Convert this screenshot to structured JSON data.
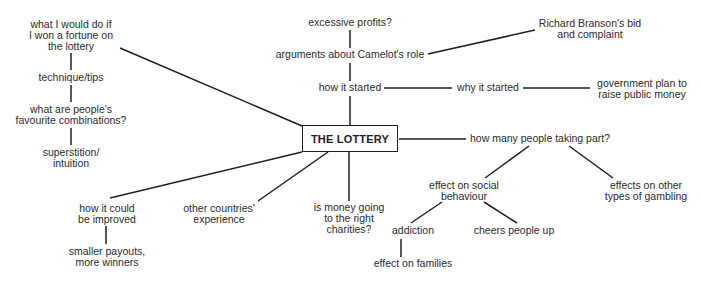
{
  "diagram": {
    "type": "mind-map",
    "center": {
      "label": "THE LOTTERY"
    },
    "nodes": {
      "excessive_profits": {
        "lines": [
          "excessive profits?"
        ]
      },
      "camelot_role": {
        "lines": [
          "arguments about Camelot's role"
        ]
      },
      "branson": {
        "lines": [
          "Richard Branson's bid",
          "and complaint"
        ]
      },
      "how_started": {
        "lines": [
          "how it started"
        ]
      },
      "why_started": {
        "lines": [
          "why it started"
        ]
      },
      "gov_plan": {
        "lines": [
          "government plan to",
          "raise public money"
        ]
      },
      "how_many": {
        "lines": [
          "how many people taking part?"
        ]
      },
      "social_behaviour": {
        "lines": [
          "effect on social",
          "behaviour"
        ]
      },
      "other_gambling": {
        "lines": [
          "effects on other",
          "types of gambling"
        ]
      },
      "addiction": {
        "lines": [
          "addiction"
        ]
      },
      "cheers": {
        "lines": [
          "cheers people up"
        ]
      },
      "families": {
        "lines": [
          "effect on families"
        ]
      },
      "charities": {
        "lines": [
          "is money going",
          "to the right",
          "charities?"
        ]
      },
      "other_countries": {
        "lines": [
          "other countries'",
          "experience"
        ]
      },
      "improved": {
        "lines": [
          "how it could",
          "be improved"
        ]
      },
      "smaller_payouts": {
        "lines": [
          "smaller payouts,",
          "more winners"
        ]
      },
      "won_fortune": {
        "lines": [
          "what I would do if",
          "I won a fortune on",
          "the lottery"
        ]
      },
      "technique": {
        "lines": [
          "technique/tips"
        ]
      },
      "favourite_combos": {
        "lines": [
          "what are people's",
          "favourite combinations?"
        ]
      },
      "superstition": {
        "lines": [
          "superstition/",
          "intuition"
        ]
      }
    },
    "edges": [
      [
        "center",
        "how_started"
      ],
      [
        "how_started",
        "camelot_role"
      ],
      [
        "camelot_role",
        "excessive_profits"
      ],
      [
        "camelot_role",
        "branson"
      ],
      [
        "how_started",
        "why_started"
      ],
      [
        "why_started",
        "gov_plan"
      ],
      [
        "center",
        "how_many"
      ],
      [
        "how_many",
        "social_behaviour"
      ],
      [
        "how_many",
        "other_gambling"
      ],
      [
        "social_behaviour",
        "addiction"
      ],
      [
        "social_behaviour",
        "cheers"
      ],
      [
        "addiction",
        "families"
      ],
      [
        "center",
        "charities"
      ],
      [
        "center",
        "other_countries"
      ],
      [
        "center",
        "improved"
      ],
      [
        "improved",
        "smaller_payouts"
      ],
      [
        "center",
        "won_fortune"
      ],
      [
        "won_fortune",
        "technique"
      ],
      [
        "technique",
        "favourite_combos"
      ],
      [
        "favourite_combos",
        "superstition"
      ]
    ],
    "colors": {
      "line": "#1f1f1f",
      "text": "#2b2b2b",
      "background": "#ffffff"
    }
  }
}
